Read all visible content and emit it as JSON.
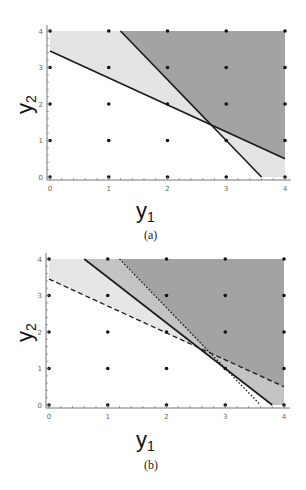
{
  "chart_data": [
    {
      "type": "area",
      "caption": "(a)",
      "xlabel": "y1",
      "ylabel": "y2",
      "xlim": [
        0,
        4
      ],
      "ylim": [
        0,
        4
      ],
      "xticks": [
        "0",
        "1",
        "2",
        "3",
        "4"
      ],
      "yticks": [
        "0",
        "1",
        "2",
        "3",
        "4"
      ],
      "lattice_points": "integer grid 0..4 x 0..4",
      "lines": [
        {
          "name": "constraint-1",
          "style": "solid",
          "points": [
            [
              0,
              3.45
            ],
            [
              4,
              0.5
            ]
          ]
        },
        {
          "name": "constraint-2",
          "style": "solid",
          "points": [
            [
              1.2,
              4
            ],
            [
              3.6,
              0
            ]
          ]
        }
      ],
      "intersection": [
        2.7,
        1.45
      ],
      "regions": [
        {
          "name": "light-region",
          "shade": "#e3e3e3",
          "polygon": [
            [
              0,
              4
            ],
            [
              0,
              3.45
            ],
            [
              4,
              0.5
            ],
            [
              4,
              0
            ],
            [
              3.6,
              0
            ],
            [
              1.2,
              4
            ]
          ],
          "note": "above either line"
        },
        {
          "name": "dark-region",
          "shade": "#a3a3a3",
          "polygon": [
            [
              1.2,
              4
            ],
            [
              2.7,
              1.45
            ],
            [
              4,
              0.5
            ],
            [
              4,
              4
            ]
          ],
          "note": "above both lines"
        }
      ]
    },
    {
      "type": "area",
      "caption": "(b)",
      "xlabel": "y1",
      "ylabel": "y2",
      "xlim": [
        0,
        4
      ],
      "ylim": [
        0,
        4
      ],
      "xticks": [
        "0",
        "1",
        "2",
        "3",
        "4"
      ],
      "yticks": [
        "0",
        "1",
        "2",
        "3",
        "4"
      ],
      "lattice_points": "integer grid 0..4 x 0..4",
      "lines": [
        {
          "name": "constraint-1",
          "style": "dashed",
          "points": [
            [
              0,
              3.45
            ],
            [
              4,
              0.5
            ]
          ]
        },
        {
          "name": "constraint-2",
          "style": "dotted",
          "points": [
            [
              1.2,
              4
            ],
            [
              3.6,
              0
            ]
          ]
        },
        {
          "name": "constraint-3",
          "style": "solid",
          "points": [
            [
              0.6,
              4
            ],
            [
              3.8,
              0
            ]
          ]
        }
      ],
      "regions": [
        {
          "name": "light-region",
          "shade": "#e6e6e6",
          "polygon": [
            [
              0,
              4
            ],
            [
              0,
              3.45
            ],
            [
              2.55,
              1.57
            ],
            [
              0.6,
              4
            ]
          ]
        },
        {
          "name": "mid-region",
          "shade": "#c4c4c4",
          "polygon": [
            [
              0.6,
              4
            ],
            [
              2.55,
              1.57
            ],
            [
              3.8,
              0
            ],
            [
              4,
              0
            ],
            [
              4,
              0.5
            ],
            [
              2.7,
              1.45
            ],
            [
              1.2,
              4
            ]
          ]
        },
        {
          "name": "dark-region",
          "shade": "#a3a3a3",
          "polygon": [
            [
              1.2,
              4
            ],
            [
              2.7,
              1.45
            ],
            [
              4,
              0.5
            ],
            [
              4,
              4
            ]
          ]
        }
      ]
    }
  ],
  "labels": {
    "a": {
      "xlabel": "y",
      "xsub": "1",
      "ylabel": "y",
      "ysub": "2",
      "caption": "(a)"
    },
    "b": {
      "xlabel": "y",
      "xsub": "1",
      "ylabel": "y",
      "ysub": "2",
      "caption": "(b)"
    }
  }
}
